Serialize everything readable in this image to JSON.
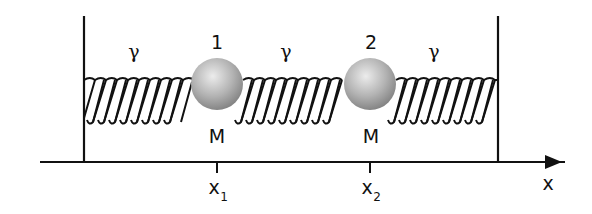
{
  "diagram": {
    "colors": {
      "line": "#111111",
      "ball_light": "#e6e6e6",
      "ball_dark": "#8a8a8a",
      "background": "#ffffff"
    },
    "masses": [
      {
        "index_label": "1",
        "mass_label": "M",
        "position_label": "x",
        "position_subscript": "1"
      },
      {
        "index_label": "2",
        "mass_label": "M",
        "position_label": "x",
        "position_subscript": "2"
      }
    ],
    "springs": [
      {
        "constant_label": "γ"
      },
      {
        "constant_label": "γ"
      },
      {
        "constant_label": "γ"
      }
    ],
    "axis": {
      "label": "x"
    }
  }
}
